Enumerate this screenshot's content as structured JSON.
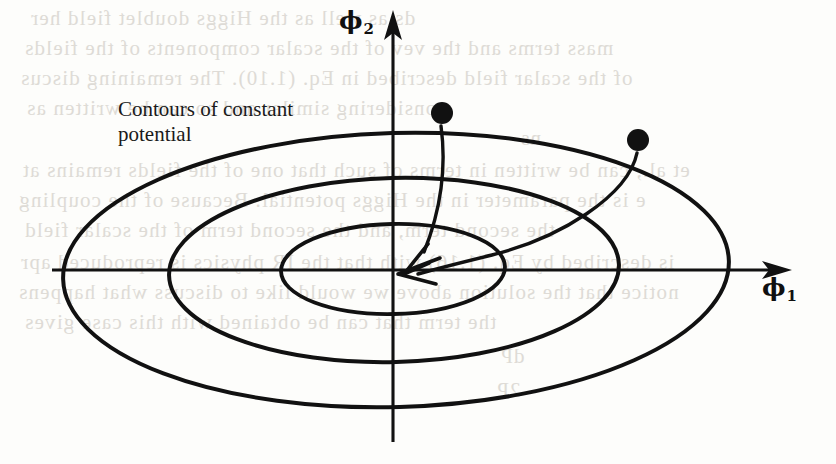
{
  "figure": {
    "type": "contour-diagram",
    "background_color": "#fdfdfb",
    "ink_color": "#111111",
    "annotation": {
      "label": "Contours of constant\npotential",
      "line1": "Contours of constant",
      "line2": "potential"
    },
    "axes": {
      "horizontal": {
        "symbol": "ϕ",
        "subscript": "1",
        "direction": "right"
      },
      "vertical": {
        "symbol": "ϕ",
        "subscript": "2",
        "direction": "up"
      },
      "origin_label": ""
    },
    "contours": [
      {
        "name": "outer-contour",
        "rx": 333,
        "ry": 137
      },
      {
        "name": "middle-contour",
        "rx": 225,
        "ry": 92
      },
      {
        "name": "inner-contour",
        "rx": 112,
        "ry": 45
      }
    ],
    "markers": [
      {
        "name": "field-point-left",
        "x": 442,
        "y": 113,
        "r": 11
      },
      {
        "name": "field-point-right",
        "x": 638,
        "y": 140,
        "r": 11
      }
    ],
    "arrows": [
      {
        "name": "arrow-from-left-point",
        "from": "field-point-left",
        "to": "origin"
      },
      {
        "name": "arrow-from-right-point",
        "from": "field-point-right",
        "to": "origin"
      }
    ]
  },
  "bleed_through": [
    {
      "text": "ds as well as the Higgs doublet field her",
      "x": 30,
      "y": 6
    },
    {
      "text": "mass terms and the vev of the scalar components of the fields",
      "x": 24,
      "y": 36
    },
    {
      "text": "of the scalar field described in Eq. (1.10). The remaining discus",
      "x": 20,
      "y": 66
    },
    {
      "text": "considering similar and so can be written as",
      "x": 26,
      "y": 96
    },
    {
      "text": "ns",
      "x": 520,
      "y": 126
    },
    {
      "text": "et al., can be written in terms of such that one of the fields remains at",
      "x": 22,
      "y": 158
    },
    {
      "text": "e is the parameter in the Higgs potential. Because of the coupling",
      "x": 18,
      "y": 188
    },
    {
      "text": "the second term, and the second term of the scalar field",
      "x": 24,
      "y": 218
    },
    {
      "text": "is described by Eq. (1.16) with that the IR physics is reproduced apr",
      "x": 20,
      "y": 250
    },
    {
      "text": "notice that the solution above we would like to discuss what happens",
      "x": 18,
      "y": 280
    },
    {
      "text": "the term that can be obtained with this case gives",
      "x": 24,
      "y": 310
    },
    {
      "text": "dP",
      "x": 500,
      "y": 344
    },
    {
      "text": "2P",
      "x": 496,
      "y": 378
    }
  ]
}
